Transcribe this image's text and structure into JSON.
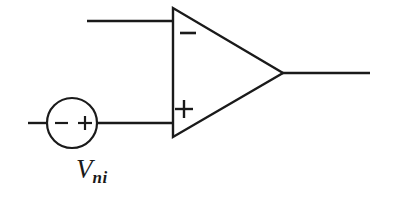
{
  "diagram": {
    "type": "circuit-schematic",
    "background_color": "#ffffff",
    "line_color": "#1a1a1a",
    "line_width": 2.2
  },
  "opamp": {
    "name": "operational-amplifier",
    "inverting_marker": "−",
    "noninverting_marker": "+",
    "shape": "triangle",
    "apex_x": 283,
    "apex_y": 73,
    "left_edge_x": 172,
    "top_y": 8,
    "bottom_y": 137
  },
  "source": {
    "name": "voltage-source",
    "shape": "circle",
    "negative_terminal": "−",
    "positive_terminal": "+",
    "label_main": "V",
    "label_subscript": "ni",
    "center_x": 72,
    "center_y": 123,
    "radius": 25
  },
  "wires": {
    "inverting_input": {
      "label": "inverting-input-wire",
      "x1": 87,
      "y1": 21,
      "x2": 172,
      "y2": 21
    },
    "noninverting_input_left_stub": {
      "label": "source-left-lead",
      "x1": 28,
      "y1": 123,
      "x2": 47,
      "y2": 123
    },
    "noninverting_input_right": {
      "label": "source-to-opamp-wire",
      "x1": 97,
      "y1": 123,
      "x2": 172,
      "y2": 123
    },
    "output": {
      "label": "output-wire",
      "x1": 283,
      "y1": 73,
      "x2": 370,
      "y2": 73
    }
  }
}
